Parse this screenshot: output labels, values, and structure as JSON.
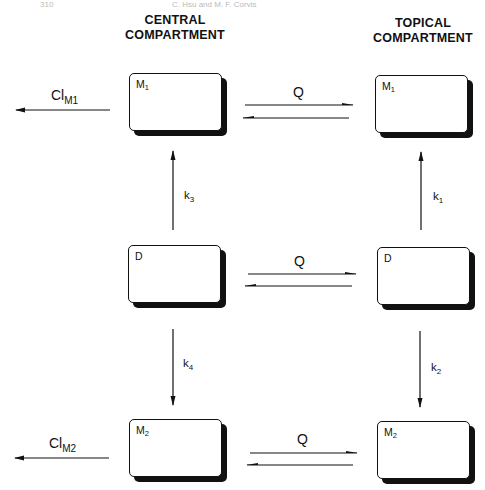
{
  "page_header": {
    "left": "310",
    "right": "C. Hsu and M. F. Corvis"
  },
  "columns": {
    "central": {
      "line1": "CENTRAL",
      "line2": "COMPARTMENT"
    },
    "topical": {
      "line1": "TOPICAL",
      "line2": "COMPARTMENT"
    }
  },
  "boxes": {
    "central_m1": {
      "base": "M",
      "sub": "1"
    },
    "central_d": {
      "base": "D",
      "sub": ""
    },
    "central_m2": {
      "base": "M",
      "sub": "2"
    },
    "topical_m1": {
      "base": "M",
      "sub": "1"
    },
    "topical_d": {
      "base": "D",
      "sub": ""
    },
    "topical_m2": {
      "base": "M",
      "sub": "2"
    }
  },
  "flows": {
    "cl_m1": {
      "base": "Cl",
      "sub": "M1"
    },
    "cl_m2": {
      "base": "Cl",
      "sub": "M2"
    },
    "q_top": "Q",
    "q_mid": "Q",
    "q_bot": "Q",
    "k1": {
      "base": "k",
      "sub": "1"
    },
    "k2": {
      "base": "k",
      "sub": "2"
    },
    "k3": {
      "base": "k",
      "sub": "3"
    },
    "k4": {
      "base": "k",
      "sub": "4"
    }
  },
  "colors": {
    "ink": "#111111",
    "background": "#ffffff"
  }
}
